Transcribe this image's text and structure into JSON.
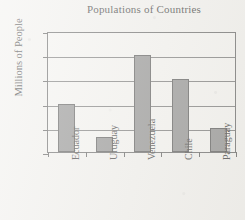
{
  "chart_data": {
    "type": "bar",
    "title": "Populations of Countries",
    "xlabel": "",
    "ylabel": "Millions of People",
    "categories": [
      "Ecuador",
      "Uruguay",
      "Venezuela",
      "Chile",
      "Paraguay"
    ],
    "values": [
      10,
      3,
      20,
      15,
      5
    ],
    "ylim": [
      0,
      25
    ],
    "ytick_labels": [
      "0",
      "5",
      "10",
      "15",
      "20",
      "25"
    ],
    "ytick_values": [
      0,
      5,
      10,
      15,
      20,
      25
    ],
    "grid": "horizontal",
    "legend": "none",
    "bar_color": "#878787",
    "bar_edge_color": "#4a4a4a",
    "axis_color": "#5a5a5a",
    "background_color": "#f2f1ee"
  }
}
